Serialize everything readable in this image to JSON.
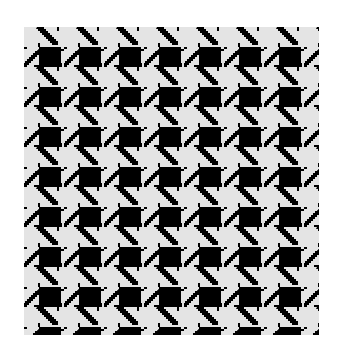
{
  "image": {
    "subject": "houndstooth-pattern-swatch",
    "pattern_name": "Houndstooth",
    "colors": {
      "background": "#ffffff",
      "fabric_light": "#e4e4e4",
      "fabric_dark": "#000000"
    },
    "tile_size_px": 40,
    "columns_visible": 7.4,
    "rows_visible": 7.7
  }
}
